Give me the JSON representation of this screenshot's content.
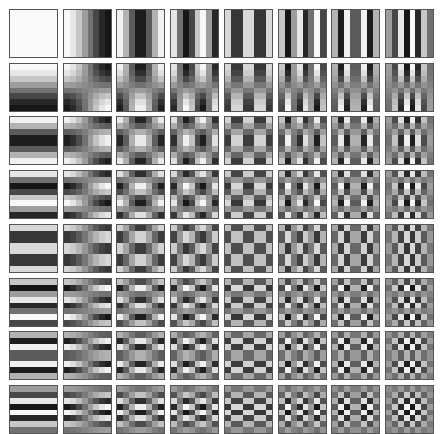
{
  "figure": {
    "title": "",
    "rows": 8,
    "cols": 8,
    "block_size": 8,
    "origin": [
      9,
      9
    ],
    "pitch": [
      53.7,
      53.7
    ],
    "tile_size": 47,
    "border_color": "#555555",
    "background": "#ffffff"
  }
}
